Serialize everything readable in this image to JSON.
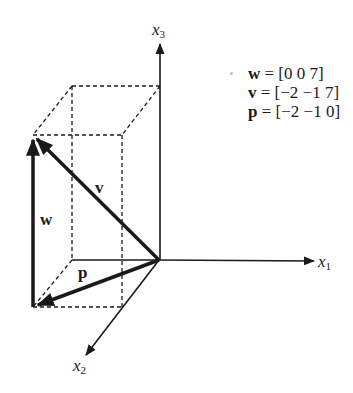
{
  "diagram": {
    "axes": [
      {
        "name": "x1",
        "label": "x",
        "sub": "1"
      },
      {
        "name": "x2",
        "label": "x",
        "sub": "2"
      },
      {
        "name": "x3",
        "label": "x",
        "sub": "3"
      }
    ],
    "vectors": [
      {
        "name": "w",
        "label": "w",
        "value": "[0 0 7]"
      },
      {
        "name": "v",
        "label": "v",
        "value": "[−2 −1 7]"
      },
      {
        "name": "p",
        "label": "p",
        "value": "[−2 −1 0]"
      }
    ],
    "legend": [
      {
        "var": "w",
        "eq": " = [0 0 7]"
      },
      {
        "var": "v",
        "eq": " = [−2 −1 7]"
      },
      {
        "var": "p",
        "eq": " = [−2 −1 0]"
      }
    ],
    "colors": {
      "ink": "#1a1a1a",
      "background": "#ffffff"
    }
  }
}
